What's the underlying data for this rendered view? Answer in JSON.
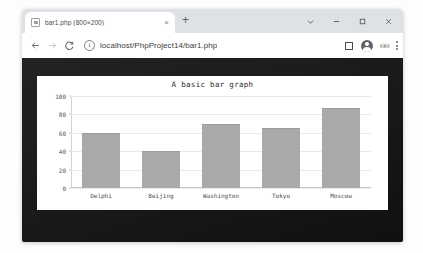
{
  "browser": {
    "tab": {
      "title": "bar1.php (800×200)",
      "favicon_name": "image-file-icon",
      "close_label": "×"
    },
    "new_tab_label": "+",
    "window_controls": [
      {
        "name": "chevron-down-button",
        "label": "⌄"
      },
      {
        "name": "minimize-button",
        "label": "–"
      },
      {
        "name": "maximize-button",
        "label": "□"
      },
      {
        "name": "close-button",
        "label": "✕"
      }
    ],
    "toolbar": {
      "back_label": "←",
      "forward_label": "→",
      "reload_label": "C",
      "info_label": "i",
      "url": "localhost/PhpProject14/bar1.php",
      "url_placeholder": "Search Google or type a URL",
      "bookmark_name": "bookmark-icon",
      "profile_name": "profile-avatar-icon",
      "extensions_label": "⛁⛁",
      "menu_name": "kebab-menu-icon"
    }
  },
  "chart_data": {
    "type": "bar",
    "title": "A basic bar graph",
    "xlabel": "",
    "ylabel": "",
    "categories": [
      "Delphi",
      "Beijing",
      "Washington",
      "Tokyo",
      "Moscow"
    ],
    "values": [
      60,
      40,
      70,
      65,
      87
    ],
    "ylim": [
      0,
      100
    ],
    "yticks": [
      0,
      20,
      40,
      60,
      80,
      100
    ],
    "grid": true,
    "legend": false,
    "bar_color": "#a9a9a9",
    "background": "#ffffff"
  }
}
